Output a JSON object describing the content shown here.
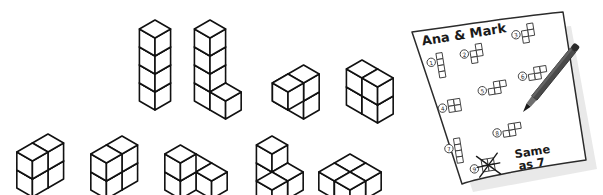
{
  "canvas": {
    "width": 603,
    "height": 195,
    "background": "#ffffff"
  },
  "colors": {
    "ink": "#1a1a1a",
    "cube_stroke": "#111111",
    "cube_fill": "#ffffff",
    "paper_fill": "#ffffff",
    "paper_stroke": "#2b2b2b",
    "paper_shadow": "#cfcfcf",
    "pencil_body": "#4a4a4a",
    "pencil_dark": "#2b2b2b",
    "pencil_tip": "#1a1a1a",
    "sketch_stroke": "#3a3a3a"
  },
  "scene": {
    "title": "Isometric cube structures with a handwritten worksheet",
    "cube_unit": 18
  },
  "cube_figures": [
    {
      "id": "figure-1",
      "name": "vertical-tower-4",
      "label": "4-cube vertical tower",
      "origin": {
        "x": 155,
        "y": 92
      },
      "cells": [
        [
          0,
          0,
          0
        ],
        [
          0,
          0,
          1
        ],
        [
          0,
          0,
          2
        ],
        [
          0,
          0,
          3
        ]
      ]
    },
    {
      "id": "figure-2",
      "name": "l-tower-3-plus-1",
      "label": "3-cube tower with one cube at base right",
      "origin": {
        "x": 210,
        "y": 92
      },
      "cells": [
        [
          0,
          0,
          0
        ],
        [
          0,
          0,
          1
        ],
        [
          0,
          0,
          2
        ],
        [
          0,
          0,
          3
        ],
        [
          1,
          0,
          0
        ]
      ]
    },
    {
      "id": "figure-3",
      "name": "stair-step-s",
      "label": "stepped S arrangement",
      "origin": {
        "x": 288,
        "y": 92
      },
      "cells": [
        [
          0,
          0,
          0
        ],
        [
          1,
          0,
          0
        ],
        [
          1,
          0,
          1
        ],
        [
          1,
          1,
          1
        ]
      ]
    },
    {
      "id": "figure-4",
      "name": "block-2x2",
      "label": "2 by 2 block wall",
      "origin": {
        "x": 362,
        "y": 96
      },
      "cells": [
        [
          0,
          0,
          0
        ],
        [
          1,
          0,
          0
        ],
        [
          0,
          0,
          1
        ],
        [
          1,
          0,
          1
        ]
      ]
    },
    {
      "id": "figure-5",
      "name": "tri-corner-stack",
      "label": "three cube corner stack",
      "origin": {
        "x": 48,
        "y": 170
      },
      "cells": [
        [
          0,
          0,
          0
        ],
        [
          0,
          1,
          0
        ],
        [
          0,
          1,
          1
        ],
        [
          0,
          0,
          1
        ]
      ]
    },
    {
      "id": "figure-6",
      "name": "two-base-one-top",
      "label": "two base cubes with one raised cube",
      "origin": {
        "x": 122,
        "y": 172
      },
      "cells": [
        [
          0,
          0,
          0
        ],
        [
          0,
          1,
          0
        ],
        [
          0,
          1,
          1
        ],
        [
          0,
          0,
          1
        ]
      ]
    },
    {
      "id": "figure-7",
      "name": "row-with-raised",
      "label": "row of cubes with one raised",
      "origin": {
        "x": 196,
        "y": 172
      },
      "cells": [
        [
          0,
          0,
          0
        ],
        [
          1,
          0,
          0
        ],
        [
          0,
          1,
          0
        ],
        [
          0,
          1,
          1
        ]
      ]
    },
    {
      "id": "figure-8",
      "name": "v-split-pair",
      "label": "two pairs forming a V",
      "origin": {
        "x": 272,
        "y": 172
      },
      "cells": [
        [
          0,
          0,
          0
        ],
        [
          0,
          0,
          1
        ],
        [
          1,
          1,
          0
        ],
        [
          1,
          0,
          0
        ]
      ]
    },
    {
      "id": "figure-9",
      "name": "tri-fan",
      "label": "three cube fan arrangement",
      "origin": {
        "x": 350,
        "y": 172
      },
      "cells": [
        [
          0,
          0,
          0
        ],
        [
          1,
          0,
          0
        ],
        [
          0,
          1,
          0
        ],
        [
          1,
          1,
          0
        ]
      ]
    }
  ],
  "paper": {
    "name": "worksheet-paper",
    "title": "Ana & Mark",
    "note_line_1": "Same",
    "note_line_2": "as 7",
    "items": [
      {
        "number": "1",
        "marker": "①",
        "shape": "I-tetromino-vertical",
        "crossed_out": false
      },
      {
        "number": "2",
        "marker": "②",
        "shape": "S-tetromino",
        "crossed_out": false
      },
      {
        "number": "3",
        "marker": "③",
        "shape": "S-tetromino",
        "crossed_out": false
      },
      {
        "number": "4",
        "marker": "④",
        "shape": "O-tetromino-square",
        "crossed_out": false
      },
      {
        "number": "5",
        "marker": "⑤",
        "shape": "S-tetromino-horizontal",
        "crossed_out": false
      },
      {
        "number": "6",
        "marker": "⑥",
        "shape": "S-tetromino-horizontal",
        "crossed_out": false
      },
      {
        "number": "7",
        "marker": "⑦",
        "shape": "I-tetromino-vertical",
        "crossed_out": false
      },
      {
        "number": "8",
        "marker": "⑧",
        "shape": "S-tetromino-horizontal",
        "crossed_out": false
      },
      {
        "number": "9",
        "marker": "⑨",
        "shape": "O-tetromino-square",
        "crossed_out": true
      }
    ]
  },
  "pencil": {
    "name": "pencil",
    "label": "pencil resting on paper",
    "tip": {
      "x": 523,
      "y": 112
    },
    "tail": {
      "x": 578,
      "y": 44
    }
  }
}
